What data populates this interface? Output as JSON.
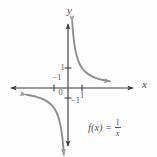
{
  "figure": {
    "background_color": "#fdfdfd",
    "axis_color": "#3c3c3c",
    "curve_color": "#8f8f93",
    "text_color": "#55555a"
  },
  "axes": {
    "x_label": "x",
    "y_label": "y",
    "origin_label": "0"
  },
  "ticks": {
    "x_negative_one": "−1",
    "x_positive_one": "1",
    "y_positive_one": "1",
    "y_negative_one": "−1"
  },
  "annotation": {
    "function_name": "f(x)",
    "equals": "=",
    "numerator": "1",
    "denominator": "x",
    "full_text": "f(x) = 1/x"
  },
  "chart_data": {
    "type": "line",
    "title": "",
    "subtitle": "",
    "xlabel": "x",
    "ylabel": "y",
    "xlim": [
      -3.5,
      3.5
    ],
    "ylim": [
      -3.5,
      3.5
    ],
    "xticks": [
      -1,
      1
    ],
    "xticklabels": [
      "−1",
      "1"
    ],
    "yticks": [
      -1,
      1
    ],
    "yticklabels": [
      "−1",
      "1"
    ],
    "grid": false,
    "legend": null,
    "annotations": [
      {
        "text": "f(x) = 1/x",
        "x": 1.7,
        "y": -1.7
      }
    ],
    "series": [
      {
        "name": "f(x) = 1/x (branch x > 0)",
        "equation": "y = 1/x",
        "x": [
          0.3,
          0.35,
          0.4,
          0.5,
          0.6,
          0.7,
          0.8,
          0.9,
          1.0,
          1.25,
          1.5,
          1.75,
          2.0,
          2.25,
          2.5,
          2.75,
          3.0
        ],
        "values": [
          3.33,
          2.86,
          2.5,
          2.0,
          1.67,
          1.43,
          1.25,
          1.11,
          1.0,
          0.8,
          0.67,
          0.57,
          0.5,
          0.44,
          0.4,
          0.36,
          0.33
        ],
        "arrow_start": true,
        "arrow_end": true
      },
      {
        "name": "f(x) = 1/x (branch x < 0)",
        "equation": "y = 1/x",
        "x": [
          -3.0,
          -2.75,
          -2.5,
          -2.25,
          -2.0,
          -1.75,
          -1.5,
          -1.25,
          -1.0,
          -0.9,
          -0.8,
          -0.7,
          -0.6,
          -0.5,
          -0.4,
          -0.35,
          -0.3
        ],
        "values": [
          -0.33,
          -0.36,
          -0.4,
          -0.44,
          -0.5,
          -0.57,
          -0.67,
          -0.8,
          -1.0,
          -1.11,
          -1.25,
          -1.43,
          -1.67,
          -2.0,
          -2.5,
          -2.86,
          -3.33
        ],
        "arrow_start": true,
        "arrow_end": true
      }
    ],
    "asymptotes": [
      {
        "type": "vertical",
        "value": 0
      },
      {
        "type": "horizontal",
        "value": 0
      }
    ]
  }
}
